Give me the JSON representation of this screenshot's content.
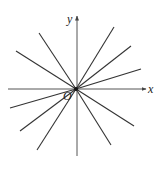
{
  "diagram": {
    "type": "pencil-of-lines-through-origin",
    "colors": {
      "line": "#333333",
      "axis": "#555555",
      "background": "#ffffff"
    },
    "origin": {
      "label": "O",
      "x": 76,
      "y": 89
    },
    "axes": {
      "x": {
        "label": "x",
        "from": [
          8,
          89
        ],
        "to": [
          146,
          89
        ]
      },
      "y": {
        "label": "y",
        "from": [
          77,
          156
        ],
        "to": [
          77,
          16
        ]
      }
    },
    "lines": [
      {
        "name": "upper-left-steep",
        "end": [
          39,
          33
        ]
      },
      {
        "name": "upper-left-shallow",
        "end": [
          16,
          51
        ]
      },
      {
        "name": "upper-right-steep",
        "end": [
          114,
          27
        ]
      },
      {
        "name": "upper-right-mid",
        "end": [
          131,
          46
        ]
      },
      {
        "name": "upper-right-shallow",
        "end": [
          141,
          69
        ]
      },
      {
        "name": "lower-left-shallow",
        "end": [
          10,
          108
        ]
      },
      {
        "name": "lower-left-mid",
        "end": [
          20,
          131
        ]
      },
      {
        "name": "lower-left-steep",
        "end": [
          37,
          150
        ]
      },
      {
        "name": "lower-right-shallow",
        "end": [
          134,
          126
        ]
      },
      {
        "name": "lower-right-steep",
        "end": [
          111,
          145
        ]
      }
    ]
  }
}
